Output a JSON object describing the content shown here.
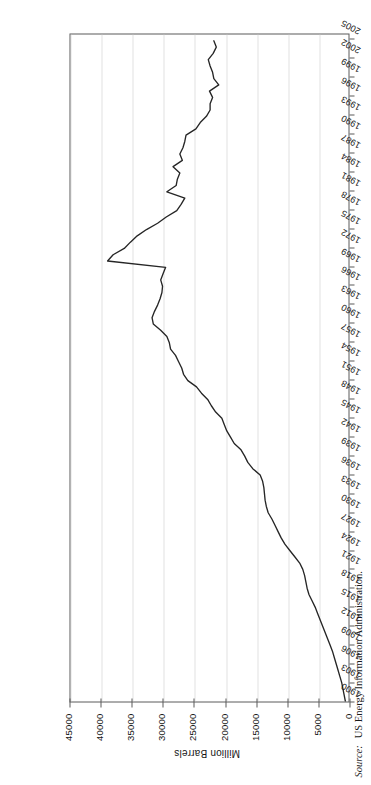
{
  "figure": {
    "orientation": "rotated-90-ccw",
    "source_label": "Source:",
    "source_text": "US Energy Information Administration."
  },
  "chart_data": {
    "type": "line",
    "title": "",
    "subtitle": "",
    "xlabel": "Year",
    "ylabel": "Million Barrels",
    "xlim": [
      1900,
      2006
    ],
    "ylim": [
      0,
      45000
    ],
    "ytick_labels": [
      "0",
      "5000",
      "10000",
      "15000",
      "20000",
      "25000",
      "30000",
      "35000",
      "40000",
      "45000"
    ],
    "yticks": [
      0,
      5000,
      10000,
      15000,
      20000,
      25000,
      30000,
      35000,
      40000,
      45000
    ],
    "xtick_labels": [
      "1900",
      "1903",
      "1906",
      "1909",
      "1912",
      "1915",
      "1918",
      "1921",
      "1924",
      "1927",
      "1930",
      "1933",
      "1936",
      "1939",
      "1942",
      "1945",
      "1948",
      "1951",
      "1954",
      "1957",
      "1960",
      "1963",
      "1966",
      "1969",
      "1972",
      "1975",
      "1978",
      "1981",
      "1984",
      "1987",
      "1990",
      "1993",
      "1996",
      "1999",
      "2002",
      "2005"
    ],
    "xticks": [
      1900,
      1903,
      1906,
      1909,
      1912,
      1915,
      1918,
      1921,
      1924,
      1927,
      1930,
      1933,
      1936,
      1939,
      1942,
      1945,
      1948,
      1951,
      1954,
      1957,
      1960,
      1963,
      1966,
      1969,
      1972,
      1975,
      1978,
      1981,
      1984,
      1987,
      1990,
      1993,
      1996,
      1999,
      2002,
      2005
    ],
    "grid": "vertical-value-gridlines-dotted",
    "legend": "none",
    "series": [
      {
        "name": "Proved Reserves",
        "color": "#262626",
        "x": [
          1900,
          1901,
          1902,
          1903,
          1904,
          1905,
          1906,
          1907,
          1908,
          1909,
          1910,
          1911,
          1912,
          1913,
          1914,
          1915,
          1916,
          1917,
          1918,
          1919,
          1920,
          1921,
          1922,
          1923,
          1924,
          1925,
          1926,
          1927,
          1928,
          1929,
          1930,
          1931,
          1932,
          1933,
          1934,
          1935,
          1936,
          1937,
          1938,
          1939,
          1940,
          1941,
          1942,
          1943,
          1944,
          1945,
          1946,
          1947,
          1948,
          1949,
          1950,
          1951,
          1952,
          1953,
          1954,
          1955,
          1956,
          1957,
          1958,
          1959,
          1960,
          1961,
          1962,
          1963,
          1964,
          1965,
          1966,
          1967,
          1968,
          1969,
          1970,
          1971,
          1972,
          1973,
          1974,
          1975,
          1976,
          1977,
          1978,
          1979,
          1980,
          1981,
          1982,
          1983,
          1984,
          1985,
          1986,
          1987,
          1988,
          1989,
          1990,
          1991,
          1992,
          1993,
          1994,
          1995,
          1996,
          1997,
          1998,
          1999,
          2000,
          2001,
          2002,
          2003,
          2004,
          2005
        ],
        "values": [
          500,
          700,
          900,
          1100,
          1400,
          1700,
          2000,
          2300,
          2600,
          3000,
          3400,
          3800,
          4200,
          4600,
          5000,
          5400,
          5900,
          6400,
          6700,
          6900,
          7100,
          7400,
          7900,
          8700,
          9500,
          10300,
          10900,
          11400,
          11900,
          12400,
          13000,
          13300,
          13500,
          13600,
          13700,
          13900,
          14300,
          15500,
          16300,
          16800,
          17400,
          18500,
          19100,
          19700,
          20100,
          20500,
          21500,
          22200,
          22800,
          23800,
          24600,
          26000,
          26700,
          27000,
          27500,
          28000,
          28800,
          29000,
          29400,
          30400,
          31600,
          31800,
          31400,
          30900,
          30500,
          30200,
          30100,
          30400,
          30000,
          29600,
          39000,
          38100,
          36300,
          35300,
          34200,
          32700,
          30900,
          29500,
          27800,
          27100,
          26500,
          29400,
          27900,
          27700,
          27300,
          28400,
          26900,
          27300,
          26800,
          26500,
          26300,
          24700,
          24000,
          23000,
          22400,
          22400,
          22000,
          22500,
          21000,
          21800,
          22000,
          22400,
          22700,
          21900,
          21400,
          21800
        ]
      }
    ]
  }
}
